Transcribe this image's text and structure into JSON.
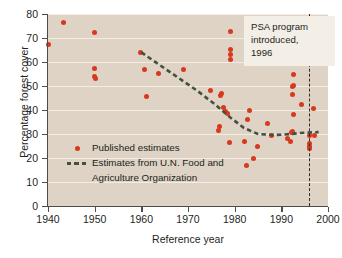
{
  "chart_data": {
    "type": "scatter",
    "title": "",
    "xlabel": "Reference year",
    "ylabel": "Percentage forest cover",
    "xlim": [
      1940,
      2000
    ],
    "ylim": [
      0,
      80
    ],
    "xticks": [
      1940,
      1950,
      1960,
      1970,
      1980,
      1990,
      2000
    ],
    "yticks": [
      0,
      10,
      20,
      30,
      40,
      50,
      60,
      70,
      80
    ],
    "grid": "horizontal",
    "legend_position": "lower-left-inside",
    "colors": {
      "point": "#d6391e",
      "fao_line": "#45503f",
      "plot_background": "#ded3c4",
      "gridline": "#f2ece3",
      "axis": "#4c4c4c",
      "annotation_background": "#f4efe6"
    },
    "series": [
      {
        "name": "Published estimates",
        "marker": "circle",
        "color": "#d6391e",
        "points": [
          [
            1940.2,
            67.2
          ],
          [
            1943.4,
            76.6
          ],
          [
            1949.9,
            72.5
          ],
          [
            1950.0,
            57.3
          ],
          [
            1950.0,
            53.9
          ],
          [
            1950.1,
            53.2
          ],
          [
            1959.9,
            64.0
          ],
          [
            1960.6,
            56.7
          ],
          [
            1961.0,
            45.6
          ],
          [
            1963.6,
            55.3
          ],
          [
            1969.0,
            57.0
          ],
          [
            1974.8,
            48.3
          ],
          [
            1976.6,
            31.4
          ],
          [
            1976.8,
            33.1
          ],
          [
            1977.0,
            46.2
          ],
          [
            1977.1,
            47.0
          ],
          [
            1977.7,
            41.0
          ],
          [
            1978.0,
            39.3
          ],
          [
            1978.4,
            38.4
          ],
          [
            1978.8,
            26.3
          ],
          [
            1979.0,
            72.7
          ],
          [
            1979.0,
            65.3
          ],
          [
            1979.0,
            63.3
          ],
          [
            1979.0,
            61.2
          ],
          [
            1982.0,
            26.8
          ],
          [
            1982.5,
            16.8
          ],
          [
            1982.8,
            35.9
          ],
          [
            1983.2,
            39.8
          ],
          [
            1984.0,
            19.6
          ],
          [
            1984.8,
            24.8
          ],
          [
            1987.0,
            34.2
          ],
          [
            1987.8,
            29.5
          ],
          [
            1991.4,
            28.3
          ],
          [
            1991.9,
            27.0
          ],
          [
            1992.2,
            30.6
          ],
          [
            1992.3,
            31.2
          ],
          [
            1992.4,
            46.4
          ],
          [
            1992.4,
            49.7
          ],
          [
            1992.5,
            50.4
          ],
          [
            1992.5,
            54.6
          ],
          [
            1992.6,
            38.0
          ],
          [
            1994.3,
            42.4
          ],
          [
            1996.0,
            29.3
          ],
          [
            1996.0,
            26.0
          ],
          [
            1996.0,
            24.8
          ],
          [
            1996.1,
            23.9
          ],
          [
            1996.9,
            40.7
          ],
          [
            1997.2,
            29.5
          ]
        ]
      },
      {
        "name": "Estimates from U.N. Food and Agriculture Organization",
        "marker": "dashed-line",
        "color": "#45503f",
        "points": [
          [
            1960.0,
            64.0
          ],
          [
            1966.0,
            56.0
          ],
          [
            1972.0,
            48.0
          ],
          [
            1976.0,
            42.0
          ],
          [
            1979.0,
            37.0
          ],
          [
            1982.0,
            32.5
          ],
          [
            1985.0,
            30.0
          ],
          [
            1988.0,
            29.6
          ],
          [
            1990.0,
            29.7
          ],
          [
            1992.0,
            30.0
          ],
          [
            1994.0,
            30.4
          ],
          [
            1996.0,
            30.6
          ],
          [
            1998.0,
            30.8
          ]
        ]
      }
    ],
    "annotations": [
      {
        "name": "psa-program-marker",
        "text_lines": [
          "PSA program",
          "introduced,",
          "1996"
        ],
        "x": 1996,
        "marker_style": "vertical-dashed-line"
      }
    ],
    "legend_entries": [
      {
        "label": "Published estimates",
        "key": "dot"
      },
      {
        "label_line1": "Estimates from U.N. Food and",
        "label_line2": "Agriculture Organization",
        "key": "dash"
      }
    ]
  }
}
